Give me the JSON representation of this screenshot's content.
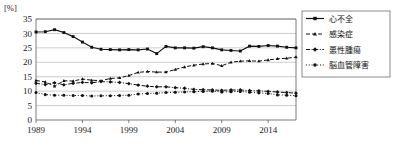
{
  "axis": {
    "unit_label": "[%]",
    "y_ticks": [
      "0",
      "5",
      "10",
      "15",
      "20",
      "25",
      "30",
      "35"
    ],
    "x_ticks": [
      "1989",
      "1994",
      "1999",
      "2004",
      "2009",
      "2014"
    ]
  },
  "legend": {
    "items": [
      {
        "label": "心不全",
        "style": "solid",
        "marker": "square"
      },
      {
        "label": "感染症",
        "style": "dashed",
        "marker": "triangle"
      },
      {
        "label": "悪性腫瘍",
        "style": "dash-dot",
        "marker": "diamond"
      },
      {
        "label": "脳血管障害",
        "style": "dotted",
        "marker": "circle"
      }
    ]
  },
  "chart_data": {
    "type": "line",
    "title": "",
    "xlabel": "",
    "ylabel": "",
    "unit": "%",
    "grid": true,
    "legend_position": "right",
    "xlim": [
      1989,
      2017
    ],
    "ylim": [
      0,
      35
    ],
    "y_ticks": [
      0,
      5,
      10,
      15,
      20,
      25,
      30,
      35
    ],
    "x_ticks": [
      1989,
      1994,
      1999,
      2004,
      2009,
      2014
    ],
    "x": [
      1989,
      1990,
      1991,
      1992,
      1993,
      1994,
      1995,
      1996,
      1997,
      1998,
      1999,
      2000,
      2001,
      2002,
      2003,
      2004,
      2005,
      2006,
      2007,
      2008,
      2009,
      2010,
      2011,
      2012,
      2013,
      2014,
      2015,
      2016,
      2017
    ],
    "series": [
      {
        "name": "心不全",
        "style": "solid",
        "marker": "square",
        "values": [
          30.5,
          30.6,
          31.3,
          30.3,
          28.9,
          27.0,
          25.2,
          24.5,
          24.4,
          24.3,
          24.4,
          24.3,
          24.6,
          23.0,
          25.5,
          25.0,
          25.0,
          24.9,
          25.4,
          25.0,
          24.3,
          24.1,
          23.9,
          25.6,
          25.5,
          25.8,
          25.6,
          25.2,
          25.0
        ]
      },
      {
        "name": "感染症",
        "style": "dashed",
        "marker": "triangle",
        "values": [
          13.7,
          13.2,
          11.7,
          13.6,
          13.5,
          14.2,
          13.8,
          13.6,
          14.4,
          14.6,
          15.4,
          16.5,
          16.8,
          16.6,
          16.6,
          17.5,
          18.4,
          19.0,
          19.4,
          19.6,
          18.8,
          20.0,
          20.4,
          20.5,
          20.4,
          20.8,
          21.2,
          21.4,
          21.8
        ]
      },
      {
        "name": "悪性腫瘍",
        "style": "dash-dot",
        "marker": "diamond",
        "values": [
          12.7,
          12.3,
          12.9,
          12.2,
          12.7,
          13.0,
          12.9,
          13.3,
          13.2,
          13.0,
          12.6,
          12.1,
          11.7,
          11.5,
          11.5,
          11.2,
          11.0,
          10.6,
          10.5,
          10.4,
          10.3,
          10.4,
          10.4,
          10.2,
          10.1,
          9.9,
          9.7,
          9.5,
          9.3
        ]
      },
      {
        "name": "脳血管障害",
        "style": "dotted",
        "marker": "circle",
        "values": [
          9.5,
          8.8,
          8.6,
          8.6,
          8.5,
          8.5,
          8.3,
          8.4,
          8.4,
          8.5,
          8.6,
          9.0,
          9.2,
          9.3,
          9.5,
          9.6,
          9.7,
          9.8,
          9.9,
          10.0,
          9.7,
          9.8,
          9.9,
          9.6,
          9.4,
          9.2,
          8.7,
          8.6,
          8.4
        ]
      }
    ]
  },
  "colors": {
    "ink": "#111111",
    "grid": "#a9a9a9",
    "frame": "#5a5a5a",
    "background": "#ffffff"
  }
}
